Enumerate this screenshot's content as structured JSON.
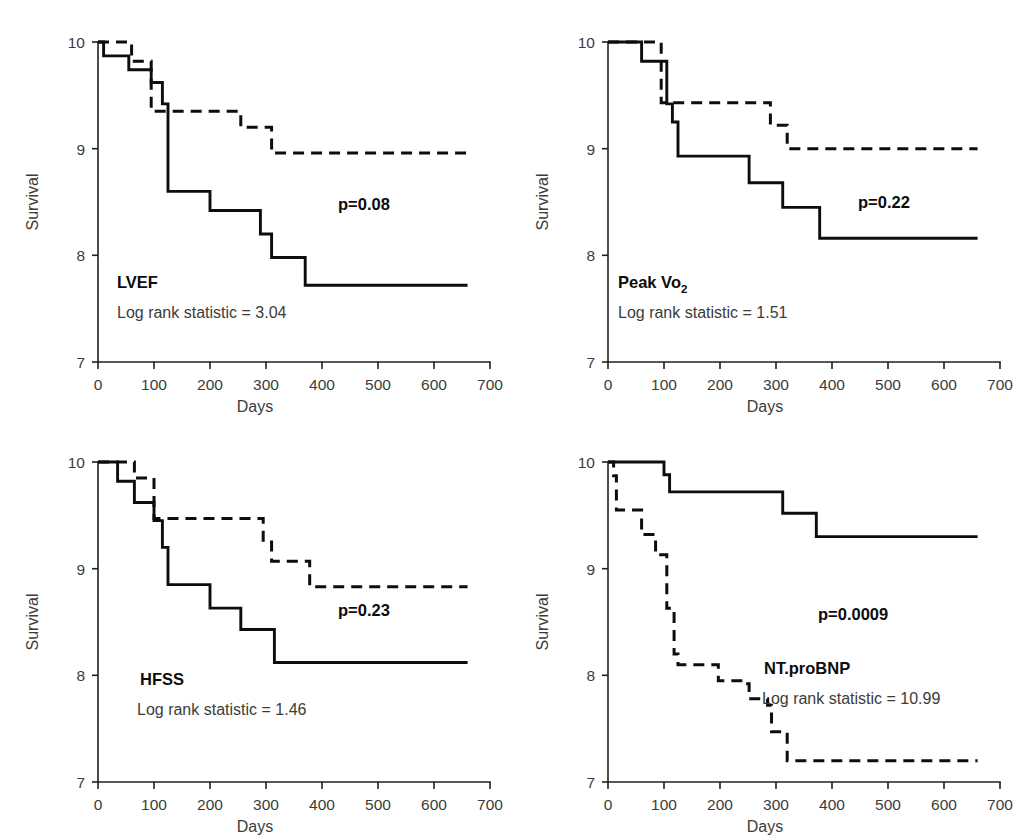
{
  "figure": {
    "title": "",
    "panel_count": 4
  },
  "chart_data": [
    {
      "type": "line",
      "id": "lvef",
      "title": "LVEF",
      "subtitle": "Log rank statistic = 3.04",
      "annotation": "p=0.08",
      "xlabel": "Days",
      "ylabel": "Survival",
      "xlim": [
        0,
        700
      ],
      "ylim": [
        7,
        10
      ],
      "xticks": [
        0,
        100,
        200,
        300,
        400,
        500,
        600,
        700
      ],
      "yticks": [
        7,
        8,
        9,
        10
      ],
      "grid": false,
      "legend": "none",
      "series": [
        {
          "name": "solid-group",
          "style": "solid",
          "x": [
            0,
            10,
            30,
            55,
            80,
            95,
            105,
            115,
            120,
            125,
            195,
            200,
            285,
            290,
            305,
            310,
            365,
            370,
            660
          ],
          "y": [
            10.0,
            9.87,
            9.87,
            9.74,
            9.74,
            9.62,
            9.62,
            9.42,
            9.42,
            8.6,
            8.6,
            8.42,
            8.42,
            8.2,
            8.2,
            7.98,
            7.98,
            7.72,
            7.72
          ]
        },
        {
          "name": "dashed-group",
          "style": "dashed",
          "x": [
            0,
            55,
            60,
            90,
            95,
            100,
            250,
            255,
            305,
            310,
            660
          ],
          "y": [
            10.0,
            10.0,
            9.82,
            9.82,
            9.35,
            9.35,
            9.35,
            9.2,
            9.2,
            8.96,
            8.96
          ]
        }
      ]
    },
    {
      "type": "line",
      "id": "peak-vo2",
      "title": "Peak Vo",
      "title_sub": "2",
      "subtitle": "Log rank statistic = 1.51",
      "annotation": "p=0.22",
      "xlabel": "Days",
      "ylabel": "Survival",
      "xlim": [
        0,
        700
      ],
      "ylim": [
        7,
        10
      ],
      "xticks": [
        0,
        100,
        200,
        300,
        400,
        500,
        600,
        700
      ],
      "yticks": [
        7,
        8,
        9,
        10
      ],
      "grid": false,
      "legend": "none",
      "series": [
        {
          "name": "solid-group",
          "style": "solid",
          "x": [
            0,
            55,
            60,
            100,
            105,
            110,
            115,
            120,
            125,
            248,
            252,
            305,
            312,
            370,
            378,
            660
          ],
          "y": [
            10.0,
            10.0,
            9.82,
            9.82,
            9.42,
            9.42,
            9.25,
            9.25,
            8.93,
            8.93,
            8.68,
            8.68,
            8.45,
            8.45,
            8.16,
            8.16
          ]
        },
        {
          "name": "dashed-group",
          "style": "dashed",
          "x": [
            0,
            90,
            95,
            105,
            110,
            285,
            290,
            315,
            320,
            660
          ],
          "y": [
            10.0,
            10.0,
            9.43,
            9.43,
            9.43,
            9.43,
            9.22,
            9.22,
            9.0,
            9.0
          ]
        }
      ]
    },
    {
      "type": "line",
      "id": "hfss",
      "title": "HFSS",
      "subtitle": "Log rank statistic = 1.46",
      "annotation": "p=0.23",
      "xlabel": "Days",
      "ylabel": "Survival",
      "xlim": [
        0,
        700
      ],
      "ylim": [
        7,
        10
      ],
      "xticks": [
        0,
        100,
        200,
        300,
        400,
        500,
        600,
        700
      ],
      "yticks": [
        7,
        8,
        9,
        10
      ],
      "grid": false,
      "legend": "none",
      "series": [
        {
          "name": "solid-group",
          "style": "solid",
          "x": [
            0,
            30,
            35,
            60,
            65,
            95,
            100,
            108,
            115,
            120,
            125,
            195,
            200,
            250,
            255,
            300,
            308,
            315,
            660
          ],
          "y": [
            10.0,
            10.0,
            9.82,
            9.82,
            9.62,
            9.62,
            9.45,
            9.45,
            9.2,
            9.2,
            8.85,
            8.85,
            8.63,
            8.63,
            8.43,
            8.43,
            8.43,
            8.12,
            8.12
          ]
        },
        {
          "name": "dashed-group",
          "style": "dashed",
          "x": [
            0,
            60,
            65,
            95,
            100,
            290,
            295,
            305,
            310,
            370,
            378,
            660
          ],
          "y": [
            10.0,
            10.0,
            9.85,
            9.85,
            9.47,
            9.47,
            9.25,
            9.25,
            9.07,
            9.07,
            8.83,
            8.83
          ]
        }
      ]
    },
    {
      "type": "line",
      "id": "nt-probnp",
      "title": "NT.proBNP",
      "subtitle": "Log rank statistic = 10.99",
      "annotation": "p=0.0009",
      "xlabel": "Days",
      "ylabel": "Survival",
      "xlim": [
        0,
        700
      ],
      "ylim": [
        7,
        10
      ],
      "xticks": [
        0,
        100,
        200,
        300,
        400,
        500,
        600,
        700
      ],
      "yticks": [
        7,
        8,
        9,
        10
      ],
      "grid": false,
      "legend": "none",
      "series": [
        {
          "name": "solid-group",
          "style": "solid",
          "x": [
            0,
            95,
            100,
            105,
            110,
            305,
            312,
            365,
            372,
            660
          ],
          "y": [
            10.0,
            10.0,
            9.88,
            9.88,
            9.72,
            9.72,
            9.52,
            9.52,
            9.3,
            9.3
          ]
        },
        {
          "name": "dashed-group",
          "style": "dashed",
          "x": [
            0,
            10,
            15,
            55,
            60,
            80,
            85,
            100,
            105,
            112,
            118,
            125,
            190,
            197,
            245,
            252,
            285,
            292,
            312,
            320,
            660
          ],
          "y": [
            10.0,
            9.87,
            9.55,
            9.55,
            9.32,
            9.32,
            9.13,
            9.13,
            8.63,
            8.63,
            8.2,
            8.1,
            8.1,
            7.95,
            7.92,
            7.78,
            7.72,
            7.47,
            7.47,
            7.2,
            7.2
          ]
        }
      ]
    }
  ]
}
